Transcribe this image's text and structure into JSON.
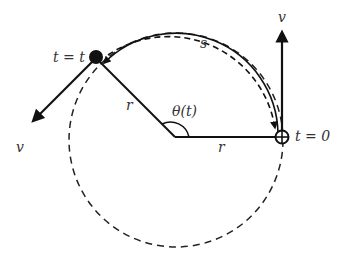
{
  "diagram": {
    "labels": {
      "start_time": "t = 0",
      "current_time": "t = t",
      "radius_1": "r",
      "radius_2": "r",
      "angle": "θ(t)",
      "arc": "s",
      "velocity_start": "v",
      "velocity_current": "v"
    },
    "colors": {
      "stroke": "#111111",
      "text": "#333333",
      "background": "#ffffff"
    }
  }
}
